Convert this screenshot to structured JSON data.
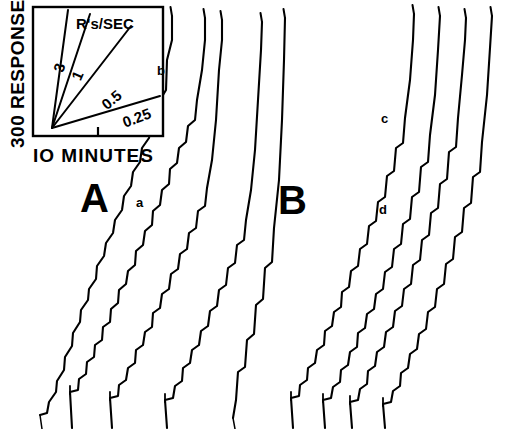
{
  "figure": {
    "type": "cumulative-response-record",
    "background": "#ffffff",
    "ink": "#000000",
    "width": 511,
    "height": 429
  },
  "axes": {
    "y_label": "300 RESPONSES",
    "x_label": "IO MINUTES"
  },
  "inset": {
    "name": "rate-reference-box",
    "header": "R's/SEC",
    "box": {
      "x": 33,
      "y": 7,
      "w": 130,
      "h": 129
    },
    "origin": {
      "x": 52,
      "y": 128
    },
    "tick": {
      "x": 98,
      "y": 136,
      "len": 9
    },
    "rate_lines": [
      {
        "label": "3",
        "angle_deg": 76,
        "end": {
          "x": 68,
          "y": 10
        },
        "label_pos": {
          "x": 55,
          "y": 60
        },
        "label_rot": -74
      },
      {
        "label": "1",
        "angle_deg": 66,
        "end": {
          "x": 90,
          "y": 14
        },
        "label_pos": {
          "x": 73,
          "y": 68
        },
        "label_rot": -66
      },
      {
        "label": "0.5",
        "angle_deg": 45,
        "end": {
          "x": 131,
          "y": 26
        },
        "label_pos": {
          "x": 101,
          "y": 92
        },
        "label_rot": -40
      },
      {
        "label": "0.25",
        "angle_deg": 20,
        "end": {
          "x": 160,
          "y": 96
        },
        "label_pos": {
          "x": 122,
          "y": 110
        },
        "label_rot": -21
      }
    ]
  },
  "panels": [
    {
      "name": "panel-A",
      "letter": "A",
      "x": 80,
      "y": 178
    },
    {
      "name": "panel-B",
      "letter": "B",
      "x": 278,
      "y": 180
    }
  ],
  "trace_labels": [
    {
      "letter": "a",
      "x": 136,
      "y": 196
    },
    {
      "letter": "b",
      "x": 157,
      "y": 64
    },
    {
      "letter": "c",
      "x": 381,
      "y": 112
    },
    {
      "letter": "d",
      "x": 379,
      "y": 203
    }
  ],
  "chart_data": {
    "type": "line",
    "title": "",
    "xlabel": "IO MINUTES",
    "ylabel": "300 RESPONSES",
    "grid": false,
    "legend": "inset rate-reference fan",
    "note": "Cumulative recorder traces. Each trace rises left-to-right as responses accumulate; short horizontal segments are pauses, small vertical pips mark reinforcements.",
    "rate_reference_values": [
      "3",
      "1",
      "0.5",
      "0.25"
    ],
    "rate_reference_units": "R's/SEC",
    "panel_labels": [
      "A",
      "B"
    ],
    "record_labels": [
      "a",
      "b",
      "c",
      "d"
    ],
    "series": [
      {
        "name": "A1",
        "panel": "A",
        "start": [
          40,
          415
        ],
        "end": [
          172,
          16
        ],
        "points": [
          [
            40,
            415
          ],
          [
            47,
            413
          ],
          [
            49,
            402
          ],
          [
            56,
            392
          ],
          [
            57,
            381
          ],
          [
            64,
            370
          ],
          [
            65,
            357
          ],
          [
            72,
            346
          ],
          [
            73,
            333
          ],
          [
            80,
            322
          ],
          [
            81,
            310
          ],
          [
            88,
            300
          ],
          [
            89,
            289
          ],
          [
            96,
            279
          ],
          [
            97,
            266
          ],
          [
            104,
            256
          ],
          [
            106,
            243
          ],
          [
            113,
            233
          ],
          [
            115,
            220
          ],
          [
            122,
            210
          ],
          [
            124,
            196
          ],
          [
            131,
            186
          ],
          [
            133,
            172
          ],
          [
            140,
            162
          ],
          [
            142,
            148
          ],
          [
            149,
            138
          ],
          [
            151,
            124
          ],
          [
            158,
            114
          ],
          [
            160,
            100
          ],
          [
            166,
            90
          ],
          [
            167,
            60
          ],
          [
            172,
            40
          ],
          [
            172,
            16
          ]
        ]
      },
      {
        "name": "A2",
        "panel": "A",
        "start": [
          72,
          428
        ],
        "end": [
          205,
          18
        ],
        "points": [
          [
            72,
            428
          ],
          [
            70,
            392
          ],
          [
            78,
            390
          ],
          [
            79,
            379
          ],
          [
            86,
            374
          ],
          [
            87,
            362
          ],
          [
            94,
            357
          ],
          [
            95,
            345
          ],
          [
            102,
            340
          ],
          [
            103,
            327
          ],
          [
            110,
            322
          ],
          [
            111,
            309
          ],
          [
            118,
            303
          ],
          [
            119,
            290
          ],
          [
            126,
            284
          ],
          [
            128,
            271
          ],
          [
            135,
            265
          ],
          [
            136,
            251
          ],
          [
            143,
            245
          ],
          [
            145,
            231
          ],
          [
            152,
            225
          ],
          [
            153,
            211
          ],
          [
            160,
            205
          ],
          [
            162,
            190
          ],
          [
            169,
            184
          ],
          [
            170,
            169
          ],
          [
            177,
            163
          ],
          [
            179,
            148
          ],
          [
            186,
            142
          ],
          [
            188,
            126
          ],
          [
            195,
            120
          ],
          [
            197,
            100
          ],
          [
            202,
            70
          ],
          [
            205,
            40
          ],
          [
            205,
            18
          ]
        ]
      },
      {
        "name": "A3",
        "panel": "A",
        "start": [
          112,
          428
        ],
        "end": [
          222,
          20
        ],
        "points": [
          [
            112,
            428
          ],
          [
            110,
            398
          ],
          [
            118,
            396
          ],
          [
            119,
            385
          ],
          [
            126,
            380
          ],
          [
            128,
            368
          ],
          [
            135,
            363
          ],
          [
            136,
            350
          ],
          [
            143,
            345
          ],
          [
            145,
            332
          ],
          [
            152,
            327
          ],
          [
            153,
            313
          ],
          [
            160,
            308
          ],
          [
            162,
            294
          ],
          [
            169,
            289
          ],
          [
            171,
            274
          ],
          [
            178,
            269
          ],
          [
            180,
            254
          ],
          [
            187,
            249
          ],
          [
            189,
            233
          ],
          [
            196,
            228
          ],
          [
            198,
            211
          ],
          [
            205,
            206
          ],
          [
            207,
            188
          ],
          [
            212,
            160
          ],
          [
            216,
            120
          ],
          [
            219,
            70
          ],
          [
            222,
            40
          ],
          [
            222,
            20
          ]
        ]
      },
      {
        "name": "A4",
        "panel": "A",
        "start": [
          167,
          428
        ],
        "end": [
          262,
          22
        ],
        "points": [
          [
            167,
            428
          ],
          [
            165,
            400
          ],
          [
            173,
            398
          ],
          [
            175,
            386
          ],
          [
            182,
            381
          ],
          [
            183,
            368
          ],
          [
            190,
            363
          ],
          [
            192,
            350
          ],
          [
            199,
            345
          ],
          [
            201,
            331
          ],
          [
            208,
            326
          ],
          [
            210,
            311
          ],
          [
            217,
            306
          ],
          [
            219,
            290
          ],
          [
            226,
            285
          ],
          [
            228,
            268
          ],
          [
            235,
            263
          ],
          [
            237,
            245
          ],
          [
            244,
            240
          ],
          [
            246,
            220
          ],
          [
            251,
            190
          ],
          [
            255,
            150
          ],
          [
            258,
            100
          ],
          [
            261,
            50
          ],
          [
            262,
            22
          ]
        ]
      },
      {
        "name": "A5",
        "panel": "A",
        "start": [
          233,
          418
        ],
        "end": [
          285,
          18
        ],
        "points": [
          [
            233,
            418
          ],
          [
            236,
            400
          ],
          [
            238,
            372
          ],
          [
            245,
            367
          ],
          [
            247,
            340
          ],
          [
            254,
            334
          ],
          [
            256,
            305
          ],
          [
            263,
            299
          ],
          [
            265,
            268
          ],
          [
            272,
            262
          ],
          [
            274,
            228
          ],
          [
            279,
            180
          ],
          [
            282,
            120
          ],
          [
            284,
            60
          ],
          [
            285,
            18
          ]
        ]
      },
      {
        "name": "B1",
        "panel": "B",
        "start": [
          293,
          428
        ],
        "end": [
          414,
          14
        ],
        "points": [
          [
            293,
            428
          ],
          [
            291,
            398
          ],
          [
            299,
            396
          ],
          [
            300,
            385
          ],
          [
            307,
            380
          ],
          [
            308,
            368
          ],
          [
            315,
            363
          ],
          [
            317,
            350
          ],
          [
            324,
            345
          ],
          [
            325,
            331
          ],
          [
            332,
            326
          ],
          [
            334,
            312
          ],
          [
            341,
            307
          ],
          [
            342,
            292
          ],
          [
            349,
            287
          ],
          [
            351,
            271
          ],
          [
            358,
            266
          ],
          [
            360,
            249
          ],
          [
            367,
            244
          ],
          [
            369,
            226
          ],
          [
            376,
            221
          ],
          [
            378,
            202
          ],
          [
            385,
            197
          ],
          [
            387,
            176
          ],
          [
            394,
            171
          ],
          [
            396,
            148
          ],
          [
            403,
            143
          ],
          [
            405,
            118
          ],
          [
            410,
            80
          ],
          [
            413,
            40
          ],
          [
            414,
            14
          ]
        ]
      },
      {
        "name": "B2",
        "panel": "B",
        "start": [
          325,
          428
        ],
        "end": [
          440,
          16
        ],
        "points": [
          [
            325,
            428
          ],
          [
            323,
            400
          ],
          [
            331,
            398
          ],
          [
            333,
            387
          ],
          [
            340,
            382
          ],
          [
            341,
            370
          ],
          [
            348,
            365
          ],
          [
            350,
            352
          ],
          [
            357,
            347
          ],
          [
            358,
            333
          ],
          [
            365,
            328
          ],
          [
            367,
            314
          ],
          [
            374,
            309
          ],
          [
            376,
            294
          ],
          [
            383,
            289
          ],
          [
            385,
            272
          ],
          [
            392,
            267
          ],
          [
            394,
            249
          ],
          [
            401,
            244
          ],
          [
            403,
            224
          ],
          [
            410,
            219
          ],
          [
            412,
            197
          ],
          [
            419,
            192
          ],
          [
            421,
            167
          ],
          [
            428,
            162
          ],
          [
            430,
            135
          ],
          [
            435,
            95
          ],
          [
            438,
            50
          ],
          [
            440,
            16
          ]
        ]
      },
      {
        "name": "B3",
        "panel": "B",
        "start": [
          352,
          428
        ],
        "end": [
          466,
          18
        ],
        "points": [
          [
            352,
            428
          ],
          [
            350,
            402
          ],
          [
            358,
            400
          ],
          [
            360,
            389
          ],
          [
            367,
            384
          ],
          [
            368,
            371
          ],
          [
            375,
            366
          ],
          [
            377,
            352
          ],
          [
            384,
            347
          ],
          [
            386,
            332
          ],
          [
            393,
            327
          ],
          [
            395,
            311
          ],
          [
            402,
            306
          ],
          [
            404,
            289
          ],
          [
            411,
            284
          ],
          [
            413,
            265
          ],
          [
            420,
            260
          ],
          [
            422,
            240
          ],
          [
            429,
            235
          ],
          [
            431,
            213
          ],
          [
            438,
            208
          ],
          [
            440,
            184
          ],
          [
            447,
            179
          ],
          [
            449,
            152
          ],
          [
            456,
            147
          ],
          [
            458,
            118
          ],
          [
            462,
            75
          ],
          [
            465,
            40
          ],
          [
            466,
            18
          ]
        ]
      },
      {
        "name": "B4",
        "panel": "B",
        "start": [
          385,
          428
        ],
        "end": [
          492,
          16
        ],
        "points": [
          [
            385,
            428
          ],
          [
            383,
            404
          ],
          [
            391,
            402
          ],
          [
            393,
            391
          ],
          [
            400,
            386
          ],
          [
            401,
            373
          ],
          [
            408,
            368
          ],
          [
            410,
            354
          ],
          [
            417,
            349
          ],
          [
            419,
            334
          ],
          [
            426,
            329
          ],
          [
            428,
            312
          ],
          [
            435,
            307
          ],
          [
            437,
            289
          ],
          [
            444,
            284
          ],
          [
            446,
            264
          ],
          [
            453,
            259
          ],
          [
            455,
            237
          ],
          [
            462,
            232
          ],
          [
            464,
            208
          ],
          [
            471,
            203
          ],
          [
            473,
            177
          ],
          [
            480,
            172
          ],
          [
            482,
            142
          ],
          [
            487,
            95
          ],
          [
            490,
            48
          ],
          [
            492,
            16
          ]
        ]
      }
    ]
  }
}
